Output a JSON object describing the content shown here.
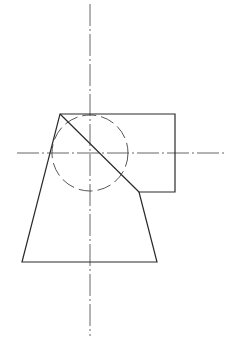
{
  "colors": {
    "line": "#2a2a2a",
    "center": "#555555",
    "hidden": "#444444",
    "background": "#ffffff"
  },
  "centerlines": {
    "vertical": {
      "x": 90,
      "y1": 4,
      "y2": 336
    },
    "horizontal": {
      "y": 153,
      "x1": 17,
      "x2": 224
    }
  },
  "outline": {
    "points": [
      [
        60,
        114
      ],
      [
        175,
        114
      ],
      [
        175,
        192
      ],
      [
        139,
        192
      ],
      [
        157,
        262
      ],
      [
        22,
        262
      ]
    ]
  },
  "diagonal": {
    "x1": 60,
    "y1": 114,
    "x2": 139,
    "y2": 192
  },
  "hidden_circle": {
    "cx": 90,
    "cy": 153,
    "r": 38
  }
}
